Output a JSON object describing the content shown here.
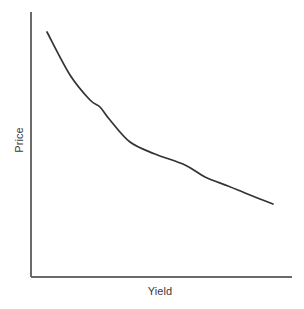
{
  "chart_data": {
    "type": "line",
    "title": "",
    "subtitle": "",
    "xlabel": "Yield",
    "ylabel": "Price",
    "grid": false,
    "legend": null,
    "legend_position": "none",
    "annotations": [],
    "xlim": [
      0,
      1
    ],
    "ylim": [
      0,
      1
    ],
    "xticks": [],
    "yticks": [],
    "xtick_labels": [],
    "ytick_labels": [],
    "axis_color": "#6a6a6a",
    "curve_color": "#333333",
    "background_color": "#ffffff",
    "series": [
      {
        "name": "Price-Yield Curve",
        "color": "#333333",
        "x": [
          0.0,
          0.09,
          0.18,
          0.26,
          0.3,
          0.35,
          0.38,
          0.45,
          0.53,
          0.59,
          0.66,
          0.77,
          0.87,
          1.0
        ],
        "y": [
          1.0,
          0.82,
          0.72,
          0.7,
          0.67,
          0.63,
          0.58,
          0.54,
          0.5,
          0.45,
          0.4,
          0.34,
          0.29,
          0.25
        ],
        "pixel_points": [
          [
            47,
            32
          ],
          [
            70,
            75
          ],
          [
            90,
            100
          ],
          [
            100,
            107
          ],
          [
            110,
            120
          ],
          [
            130,
            142
          ],
          [
            155,
            154
          ],
          [
            185,
            165
          ],
          [
            205,
            177
          ],
          [
            228,
            186
          ],
          [
            245,
            193
          ],
          [
            260,
            199
          ],
          [
            273,
            204
          ]
        ]
      }
    ],
    "axes": {
      "y_axis_pixels": {
        "x": 31,
        "y_top": 12,
        "y_bottom": 277
      },
      "x_axis_pixels": {
        "y": 277,
        "x_left": 31,
        "x_right": 292
      }
    }
  }
}
